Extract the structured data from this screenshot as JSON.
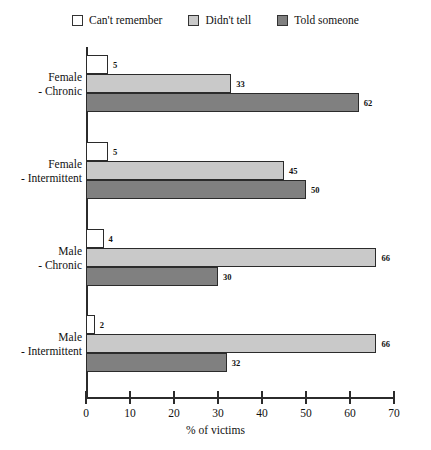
{
  "chart_data": {
    "type": "bar",
    "orientation": "horizontal",
    "title": "",
    "xlabel": "% of victims",
    "ylabel": "",
    "xlim": [
      0,
      70
    ],
    "xticks": [
      0,
      10,
      20,
      30,
      40,
      50,
      60,
      70
    ],
    "grid": false,
    "legend_position": "top",
    "categories": [
      "Female - Chronic",
      "Female - Intermittent",
      "Male - Chronic",
      "Male - Intermittent"
    ],
    "category_lines": [
      [
        "Female",
        "- Chronic"
      ],
      [
        "Female",
        "- Intermittent"
      ],
      [
        "Male",
        "- Chronic"
      ],
      [
        "Male",
        "- Intermittent"
      ]
    ],
    "series": [
      {
        "name": "Can't remember",
        "color": "#ffffff",
        "values": [
          5,
          5,
          4,
          2
        ]
      },
      {
        "name": "Didn't tell",
        "color": "#c9c9c9",
        "values": [
          33,
          45,
          66,
          66
        ]
      },
      {
        "name": "Told someone",
        "color": "#808080",
        "values": [
          62,
          50,
          30,
          32
        ]
      }
    ]
  },
  "legend": {
    "items": [
      {
        "label": "Can't remember",
        "color": "#ffffff"
      },
      {
        "label": "Didn't tell",
        "color": "#c9c9c9"
      },
      {
        "label": "Told someone",
        "color": "#808080"
      }
    ]
  },
  "axis": {
    "x_title": "% of victims",
    "x_tick_labels": [
      "0",
      "10",
      "20",
      "30",
      "40",
      "50",
      "60",
      "70"
    ]
  },
  "bar_value_labels": [
    [
      "5",
      "33",
      "62"
    ],
    [
      "5",
      "45",
      "50"
    ],
    [
      "4",
      "66",
      "30"
    ],
    [
      "2",
      "66",
      "32"
    ]
  ]
}
